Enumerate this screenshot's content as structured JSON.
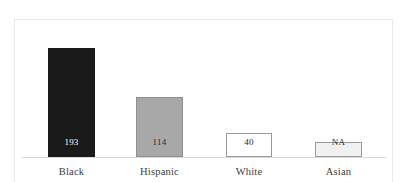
{
  "chart_data": {
    "type": "bar",
    "title": "",
    "subtitle": "",
    "xlabel": "",
    "ylabel": "",
    "categories": [
      "Black",
      "Hispanic",
      "White",
      "Asian"
    ],
    "values": [
      193,
      114,
      40,
      null
    ],
    "value_labels": [
      "193",
      "114",
      "40",
      "NA"
    ],
    "bar_colors": [
      "#1a1a1a",
      "#a8a8a8",
      "#ffffff",
      "#f0f0f0"
    ],
    "bar_border_colors": [
      "#1a1a1a",
      "#8f8f8f",
      "#9a9a9a",
      "#9a9a9a"
    ],
    "value_label_colors": [
      "#ffffff",
      "#2b2b2b",
      "#2b2b2b",
      "#2b2b2b"
    ],
    "ylim": [
      0,
      193
    ],
    "grid": false,
    "legend": false,
    "legend_position": "none",
    "annotations": [
      "NA denotes no available value for the Asian category"
    ]
  },
  "bars": [
    {
      "category": "Black",
      "value_label": "193",
      "left": 48,
      "width": 47,
      "top": 48,
      "height": 109,
      "fill": "#1a1a1a",
      "border": "#1a1a1a",
      "text_color": "#ffffff"
    },
    {
      "category": "Hispanic",
      "value_label": "114",
      "left": 136,
      "width": 47,
      "top": 97,
      "height": 60,
      "fill": "#a8a8a8",
      "border": "#8f8f8f",
      "text_color": "#2b2b2b"
    },
    {
      "category": "White",
      "value_label": "40",
      "left": 226,
      "width": 46,
      "top": 133,
      "height": 24,
      "fill": "#ffffff",
      "border": "#9a9a9a",
      "text_color": "#2b2b2b"
    },
    {
      "category": "Asian",
      "value_label": "NA",
      "left": 315,
      "width": 47,
      "top": 142,
      "height": 15,
      "fill": "#f0f0f0",
      "border": "#9a9a9a",
      "text_color": "#2b2b2b"
    }
  ],
  "axis": {
    "baseline_color": "#d9d9d9"
  },
  "frame": {
    "border_color": "#e9e9e9"
  }
}
